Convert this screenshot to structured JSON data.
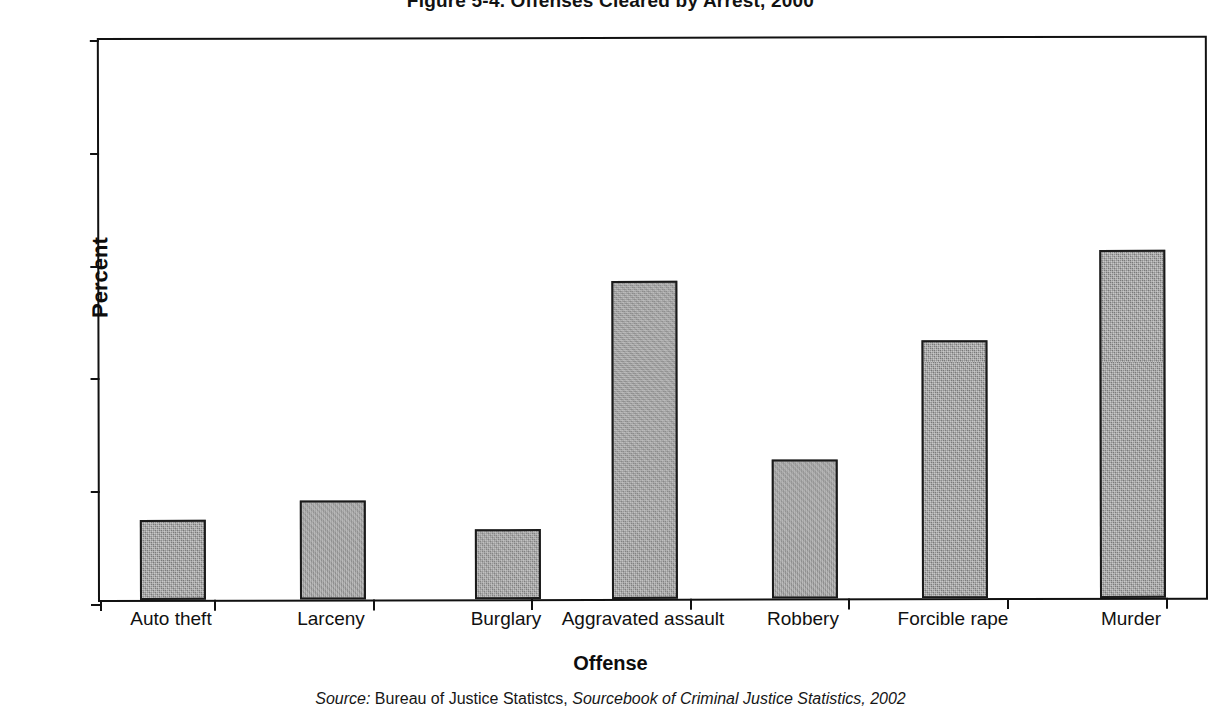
{
  "chart_data": {
    "type": "bar",
    "title": "Figure 5-4. Offenses Cleared by Arrest, 2000",
    "xlabel": "Offense",
    "ylabel": "Percent",
    "ylim": [
      0,
      100
    ],
    "yticks": [
      0,
      20,
      40,
      60,
      80,
      100
    ],
    "ytick_labels": [
      "0",
      "20",
      "40",
      "60",
      "80",
      "100"
    ],
    "grid": false,
    "legend": "none",
    "categories": [
      "Auto theft",
      "Larceny",
      "Burglary",
      "Aggravated assault",
      "Robbery",
      "Forcible rape",
      "Murder"
    ],
    "values": [
      14.1,
      17.6,
      12.5,
      56.4,
      24.7,
      45.7,
      61.7
    ],
    "bar_color": "#878787",
    "bar_edge_color": "#1a1a1a"
  },
  "source": {
    "label": "Source:",
    "agency": "Bureau of Justice Statistcs,",
    "publication": "Sourcebook of Criminal Justice Statistics,",
    "year": "2002"
  }
}
